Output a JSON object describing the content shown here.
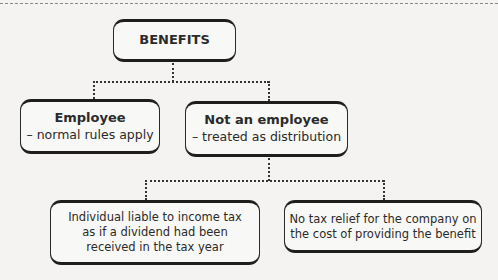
{
  "diagram": {
    "root": {
      "label": "BENEFITS"
    },
    "level1": [
      {
        "title": "Employee",
        "subtitle": "– normal rules apply"
      },
      {
        "title": "Not an employee",
        "subtitle": "– treated as distribution"
      }
    ],
    "level2": [
      {
        "lines": [
          "Individual liable to income tax",
          "as if a dividend had been",
          "received in the tax year"
        ]
      },
      {
        "lines": [
          "No tax relief for the company on",
          "the cost of providing the benefit"
        ]
      }
    ]
  }
}
